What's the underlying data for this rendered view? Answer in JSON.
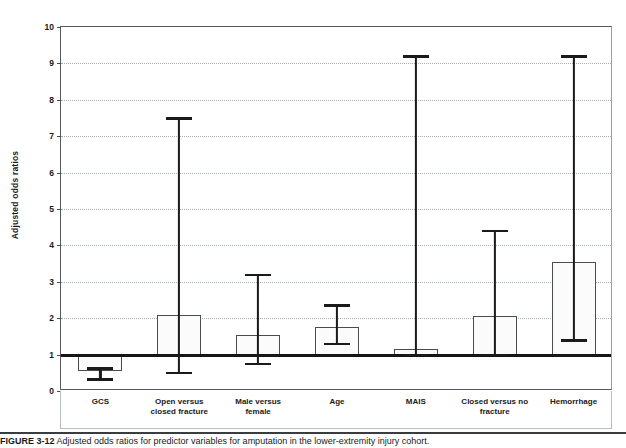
{
  "figure": {
    "caption_label": "FIGURE 3-12",
    "caption_text": "Adjusted odds ratios for predictor variables for amputation in the lower-extremity injury cohort."
  },
  "chart_data": {
    "type": "bar",
    "title": "",
    "xlabel": "",
    "ylabel": "Adjusted odds ratios",
    "ylim": [
      0,
      10
    ],
    "ytick_step": 1,
    "yticks": [
      "0",
      "1",
      "2",
      "3",
      "4",
      "5",
      "6",
      "7",
      "8",
      "9",
      "10"
    ],
    "grid": "horizontal-dotted",
    "legend": "none",
    "reference_line": 1,
    "error_bar_type": "95% confidence interval",
    "categories": [
      "GCS",
      "Open versus\nclosed fracture",
      "Male versus\nfemale",
      "Age",
      "MAIS",
      "Closed versus no\nfracture",
      "Hemorrhage"
    ],
    "values": [
      0.55,
      2.1,
      1.55,
      1.75,
      1.15,
      2.05,
      3.55
    ],
    "ci_low": [
      0.33,
      0.5,
      0.75,
      1.3,
      1.0,
      1.0,
      1.4
    ],
    "ci_high": [
      0.62,
      7.5,
      3.2,
      2.35,
      9.2,
      4.4,
      9.2
    ],
    "bar_fill": "#fbfbfb",
    "bar_stroke": "#4a4d50",
    "reference_line_color": "#161616",
    "grid_color": "#a8aeb4"
  }
}
